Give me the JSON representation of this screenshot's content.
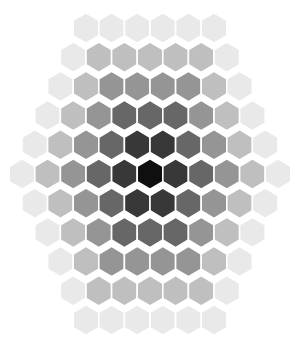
{
  "figure": {
    "title": "",
    "background_color": "#ffffff",
    "width": 305,
    "height": 340
  },
  "chart_data": {
    "type": "heatmap",
    "subtype": "hexagonal-tiling",
    "title": "",
    "subtitle": "",
    "xlabel": "",
    "ylabel": "",
    "grid": false,
    "legend": "none",
    "axis_visible": false,
    "tick_labels": [],
    "annotations": [],
    "colormap": "Greys",
    "colormap_reversed": true,
    "value_range": [
      0,
      1
    ],
    "color_dark": "#0a0a0a",
    "color_light": "#f2f2f2",
    "gap_color": "#ffffff",
    "gap_width": 1.6,
    "orientation": "pointy-top",
    "grid_radius": 5,
    "cell_count": 91,
    "center_pixel": [
      150,
      174
    ],
    "pitch_x": 25.6,
    "pitch_y": 29.2,
    "hex_radius": 15.2,
    "row_counts": [
      6,
      7,
      8,
      9,
      10,
      11,
      10,
      9,
      8,
      7,
      6
    ],
    "gradient_model": "value = clamp(distance_from_center / 5.2, 0, 1)",
    "cells": [
      {
        "q": 0,
        "r": -5,
        "s": 5,
        "value": 0.96
      },
      {
        "q": 1,
        "r": -5,
        "s": 4,
        "value": 0.96
      },
      {
        "q": 2,
        "r": -5,
        "s": 3,
        "value": 0.96
      },
      {
        "q": 3,
        "r": -5,
        "s": 2,
        "value": 0.96
      },
      {
        "q": 4,
        "r": -5,
        "s": 1,
        "value": 0.96
      },
      {
        "q": 5,
        "r": -5,
        "s": 0,
        "value": 0.96
      },
      {
        "q": -1,
        "r": -4,
        "s": 5,
        "value": 0.96
      },
      {
        "q": 0,
        "r": -4,
        "s": 4,
        "value": 0.78
      },
      {
        "q": 1,
        "r": -4,
        "s": 3,
        "value": 0.78
      },
      {
        "q": 2,
        "r": -4,
        "s": 2,
        "value": 0.78
      },
      {
        "q": 3,
        "r": -4,
        "s": 1,
        "value": 0.78
      },
      {
        "q": 4,
        "r": -4,
        "s": 0,
        "value": 0.78
      },
      {
        "q": 5,
        "r": -4,
        "s": -1,
        "value": 0.96
      },
      {
        "q": -2,
        "r": -3,
        "s": 5,
        "value": 0.96
      },
      {
        "q": -1,
        "r": -3,
        "s": 4,
        "value": 0.78
      },
      {
        "q": 0,
        "r": -3,
        "s": 3,
        "value": 0.6
      },
      {
        "q": 1,
        "r": -3,
        "s": 2,
        "value": 0.6
      },
      {
        "q": 2,
        "r": -3,
        "s": 1,
        "value": 0.6
      },
      {
        "q": 3,
        "r": -3,
        "s": 0,
        "value": 0.6
      },
      {
        "q": 4,
        "r": -3,
        "s": -1,
        "value": 0.78
      },
      {
        "q": 5,
        "r": -3,
        "s": -2,
        "value": 0.96
      },
      {
        "q": -3,
        "r": -2,
        "s": 5,
        "value": 0.96
      },
      {
        "q": -2,
        "r": -2,
        "s": 4,
        "value": 0.78
      },
      {
        "q": -1,
        "r": -2,
        "s": 3,
        "value": 0.6
      },
      {
        "q": 0,
        "r": -2,
        "s": 2,
        "value": 0.4
      },
      {
        "q": 1,
        "r": -2,
        "s": 1,
        "value": 0.4
      },
      {
        "q": 2,
        "r": -2,
        "s": 0,
        "value": 0.4
      },
      {
        "q": 3,
        "r": -2,
        "s": -1,
        "value": 0.6
      },
      {
        "q": 4,
        "r": -2,
        "s": -2,
        "value": 0.78
      },
      {
        "q": 5,
        "r": -2,
        "s": -3,
        "value": 0.96
      },
      {
        "q": -4,
        "r": -1,
        "s": 5,
        "value": 0.96
      },
      {
        "q": -3,
        "r": -1,
        "s": 4,
        "value": 0.78
      },
      {
        "q": -2,
        "r": -1,
        "s": 3,
        "value": 0.6
      },
      {
        "q": -1,
        "r": -1,
        "s": 2,
        "value": 0.4
      },
      {
        "q": 0,
        "r": -1,
        "s": 1,
        "value": 0.2
      },
      {
        "q": 1,
        "r": -1,
        "s": 0,
        "value": 0.2
      },
      {
        "q": 2,
        "r": -1,
        "s": -1,
        "value": 0.4
      },
      {
        "q": 3,
        "r": -1,
        "s": -2,
        "value": 0.6
      },
      {
        "q": 4,
        "r": -1,
        "s": -3,
        "value": 0.78
      },
      {
        "q": 5,
        "r": -1,
        "s": -4,
        "value": 0.96
      },
      {
        "q": -5,
        "r": 0,
        "s": 5,
        "value": 0.96
      },
      {
        "q": -4,
        "r": 0,
        "s": 4,
        "value": 0.78
      },
      {
        "q": -3,
        "r": 0,
        "s": 3,
        "value": 0.6
      },
      {
        "q": -2,
        "r": 0,
        "s": 2,
        "value": 0.4
      },
      {
        "q": -1,
        "r": 0,
        "s": 1,
        "value": 0.2
      },
      {
        "q": 0,
        "r": 0,
        "s": 0,
        "value": 0.02
      },
      {
        "q": 1,
        "r": 0,
        "s": -1,
        "value": 0.2
      },
      {
        "q": 2,
        "r": 0,
        "s": -2,
        "value": 0.4
      },
      {
        "q": 3,
        "r": 0,
        "s": -3,
        "value": 0.6
      },
      {
        "q": 4,
        "r": 0,
        "s": -4,
        "value": 0.78
      },
      {
        "q": 5,
        "r": 0,
        "s": -5,
        "value": 0.96
      },
      {
        "q": -5,
        "r": 1,
        "s": 4,
        "value": 0.96
      },
      {
        "q": -4,
        "r": 1,
        "s": 3,
        "value": 0.78
      },
      {
        "q": -3,
        "r": 1,
        "s": 2,
        "value": 0.6
      },
      {
        "q": -2,
        "r": 1,
        "s": 1,
        "value": 0.4
      },
      {
        "q": -1,
        "r": 1,
        "s": 0,
        "value": 0.2
      },
      {
        "q": 0,
        "r": 1,
        "s": -1,
        "value": 0.2
      },
      {
        "q": 1,
        "r": 1,
        "s": -2,
        "value": 0.4
      },
      {
        "q": 2,
        "r": 1,
        "s": -3,
        "value": 0.6
      },
      {
        "q": 3,
        "r": 1,
        "s": -4,
        "value": 0.78
      },
      {
        "q": 4,
        "r": 1,
        "s": -5,
        "value": 0.96
      },
      {
        "q": -5,
        "r": 2,
        "s": 3,
        "value": 0.96
      },
      {
        "q": -4,
        "r": 2,
        "s": 2,
        "value": 0.78
      },
      {
        "q": -3,
        "r": 2,
        "s": 1,
        "value": 0.6
      },
      {
        "q": -2,
        "r": 2,
        "s": 0,
        "value": 0.4
      },
      {
        "q": -1,
        "r": 2,
        "s": -1,
        "value": 0.4
      },
      {
        "q": 0,
        "r": 2,
        "s": -2,
        "value": 0.4
      },
      {
        "q": 1,
        "r": 2,
        "s": -3,
        "value": 0.6
      },
      {
        "q": 2,
        "r": 2,
        "s": -4,
        "value": 0.78
      },
      {
        "q": 3,
        "r": 2,
        "s": -5,
        "value": 0.96
      },
      {
        "q": -5,
        "r": 3,
        "s": 2,
        "value": 0.96
      },
      {
        "q": -4,
        "r": 3,
        "s": 1,
        "value": 0.78
      },
      {
        "q": -3,
        "r": 3,
        "s": 0,
        "value": 0.6
      },
      {
        "q": -2,
        "r": 3,
        "s": -1,
        "value": 0.6
      },
      {
        "q": -1,
        "r": 3,
        "s": -2,
        "value": 0.6
      },
      {
        "q": 0,
        "r": 3,
        "s": -3,
        "value": 0.6
      },
      {
        "q": 1,
        "r": 3,
        "s": -4,
        "value": 0.78
      },
      {
        "q": 2,
        "r": 3,
        "s": -5,
        "value": 0.96
      },
      {
        "q": -5,
        "r": 4,
        "s": 1,
        "value": 0.96
      },
      {
        "q": -4,
        "r": 4,
        "s": 0,
        "value": 0.78
      },
      {
        "q": -3,
        "r": 4,
        "s": -1,
        "value": 0.78
      },
      {
        "q": -2,
        "r": 4,
        "s": -2,
        "value": 0.78
      },
      {
        "q": -1,
        "r": 4,
        "s": -3,
        "value": 0.78
      },
      {
        "q": 0,
        "r": 4,
        "s": -4,
        "value": 0.78
      },
      {
        "q": 1,
        "r": 4,
        "s": -5,
        "value": 0.96
      },
      {
        "q": -5,
        "r": 5,
        "s": 0,
        "value": 0.96
      },
      {
        "q": -4,
        "r": 5,
        "s": -1,
        "value": 0.96
      },
      {
        "q": -3,
        "r": 5,
        "s": -2,
        "value": 0.96
      },
      {
        "q": -2,
        "r": 5,
        "s": -3,
        "value": 0.96
      },
      {
        "q": -1,
        "r": 5,
        "s": -4,
        "value": 0.96
      },
      {
        "q": 0,
        "r": 5,
        "s": -5,
        "value": 0.96
      }
    ]
  }
}
